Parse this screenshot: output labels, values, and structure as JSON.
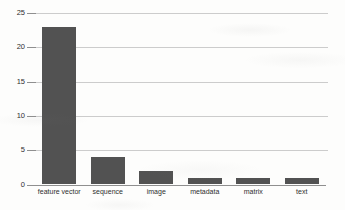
{
  "chart_data": {
    "type": "bar",
    "title": "",
    "xlabel": "",
    "ylabel": "",
    "categories": [
      "feature vector",
      "sequence",
      "image",
      "metadata",
      "matrix",
      "text"
    ],
    "values": [
      23,
      4,
      2,
      1,
      1,
      1
    ],
    "yticks": [
      0,
      5,
      10,
      15,
      20,
      25
    ],
    "ylim": [
      0,
      25
    ],
    "grid": true,
    "legend_position": "none",
    "colors": {
      "bar": "#525252",
      "gridline": "#cccccc",
      "axis": "#8f8f8f",
      "tick_text": "#2f2f2f"
    }
  }
}
